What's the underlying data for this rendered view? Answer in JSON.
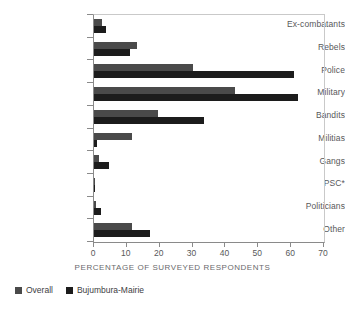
{
  "chart_data": {
    "type": "bar",
    "orientation": "horizontal",
    "title": "",
    "xlabel": "PERCENTAGE OF SURVEYED RESPONDENTS",
    "ylabel": "",
    "xlim": [
      0,
      70
    ],
    "xticks": [
      0,
      10,
      20,
      30,
      40,
      50,
      60,
      70
    ],
    "grid": false,
    "legend_position": "bottom-left",
    "categories": [
      "Ex-combatants",
      "Rebels",
      "Police",
      "Military",
      "Bandits",
      "Militias",
      "Gangs",
      "PSC*",
      "Politicians",
      "Other"
    ],
    "series": [
      {
        "name": "Overall",
        "color": "#4a4a4a",
        "values": [
          2.5,
          13.0,
          30.0,
          43.0,
          19.5,
          11.5,
          1.5,
          0.4,
          0.6,
          11.5
        ]
      },
      {
        "name": "Bujumbura-Mairie",
        "color": "#1c1c1c",
        "values": [
          3.5,
          11.0,
          61.0,
          62.0,
          33.5,
          1.0,
          4.5,
          0.3,
          2.0,
          17.0
        ]
      }
    ]
  },
  "axis": {
    "x_title": "PERCENTAGE OF SURVEYED RESPONDENTS",
    "tick_labels": [
      "0",
      "10",
      "20",
      "30",
      "40",
      "50",
      "60",
      "70"
    ]
  },
  "legend": {
    "items": [
      {
        "label": "Overall",
        "color": "#4a4a4a"
      },
      {
        "label": "Bujumbura-Mairie",
        "color": "#1c1c1c"
      }
    ]
  },
  "colors": {
    "overall": "#4a4a4a",
    "bujumbura": "#1c1c1c",
    "axis": "#8a8a8a",
    "frame": "#c9c9c9",
    "text": "#58585a",
    "background": "#ffffff"
  }
}
